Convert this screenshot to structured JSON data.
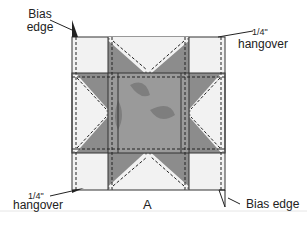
{
  "diagram": {
    "block_label": "A",
    "labels": {
      "bias_edge_top": "Bias\nedge",
      "hangover_top": "hangover",
      "hangover_top_frac": "1/4\"",
      "hangover_bottom": "hangover",
      "hangover_bottom_frac": "1/4\"",
      "bias_edge_bottom": "Bias edge"
    },
    "colors": {
      "light_fabric": "#f2f2f2",
      "dark_fabric": "#8c8c8c",
      "center_fabric": "#9a9a9a",
      "mottle": "#7e7e7e",
      "outline": "#333333",
      "seam": "#222222"
    }
  }
}
